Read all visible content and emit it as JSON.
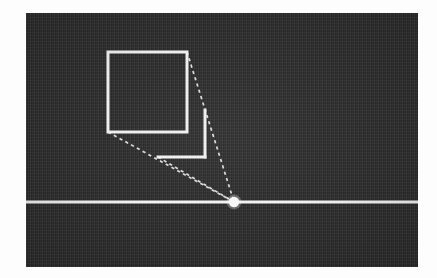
{
  "figure": {
    "background_color": "#fdfdfd",
    "plate": {
      "name": "dark scene plate",
      "x": 26,
      "y": 13,
      "width": 392,
      "height": 254,
      "fill_color": "#2f2f2f",
      "texture": "vertical scan noise"
    },
    "stroke_color": "#efefef",
    "dashed_color": "#dcdcdc"
  },
  "geometry": {
    "vanishing_point": {
      "label": "vanishing point",
      "x": 208,
      "y": 189,
      "radius": 5.2
    },
    "horizon": {
      "label": "horizon line",
      "y": 189,
      "x1": 0,
      "x2": 392,
      "width": 3.2
    },
    "front_square": {
      "label": "front face square",
      "left": 82,
      "top": 39,
      "right": 161,
      "bottom": 119,
      "stroke_width": 3
    },
    "back_square": {
      "label": "back face square (partial)",
      "left": 132,
      "top": 97,
      "right": 179,
      "bottom": 144,
      "visible_edges": [
        "right",
        "bottom"
      ],
      "stroke_width": 3
    },
    "rays": [
      {
        "name": "ray-top-right",
        "from_x": 161,
        "from_y": 39,
        "to_x": 208,
        "to_y": 189
      },
      {
        "name": "ray-back-bottom-left",
        "from_x": 132,
        "from_y": 144,
        "to_x": 208,
        "to_y": 189
      },
      {
        "name": "ray-front-bottom-left",
        "from_x": 82,
        "from_y": 119,
        "to_x": 208,
        "to_y": 189
      }
    ]
  }
}
